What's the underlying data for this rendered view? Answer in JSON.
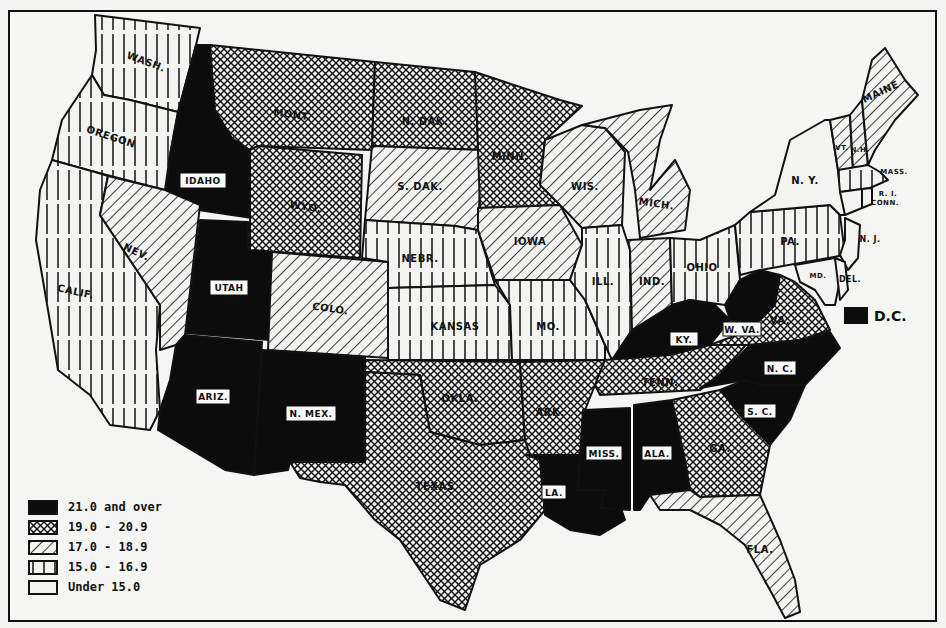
{
  "legend": {
    "items": [
      {
        "label": "21.0 and over",
        "pattern": "solid-black"
      },
      {
        "label": "19.0 - 20.9",
        "pattern": "crosshatch"
      },
      {
        "label": "17.0 - 18.9",
        "pattern": "diagonal-lines"
      },
      {
        "label": "15.0 - 16.9",
        "pattern": "vertical-lines"
      },
      {
        "label": "Under 15.0",
        "pattern": "blank"
      }
    ]
  },
  "dc": {
    "label": "D.C.",
    "category": "21.0 and over"
  },
  "states": {
    "wash": {
      "label": "WASH.",
      "category": "15.0 - 16.9"
    },
    "oregon": {
      "label": "OREGON",
      "category": "15.0 - 16.9"
    },
    "calif": {
      "label": "CALIF.",
      "category": "15.0 - 16.9"
    },
    "idaho": {
      "label": "IDAHO",
      "category": "21.0 and over"
    },
    "nev": {
      "label": "NEV.",
      "category": "17.0 - 18.9"
    },
    "utah": {
      "label": "UTAH",
      "category": "21.0 and over"
    },
    "ariz": {
      "label": "ARIZ.",
      "category": "21.0 and over"
    },
    "mont": {
      "label": "MONT.",
      "category": "19.0 - 20.9"
    },
    "wyo": {
      "label": "WYO.",
      "category": "19.0 - 20.9"
    },
    "colo": {
      "label": "COLO.",
      "category": "17.0 - 18.9"
    },
    "nmex": {
      "label": "N. MEX.",
      "category": "21.0 and over"
    },
    "ndak": {
      "label": "N. DAK.",
      "category": "19.0 - 20.9"
    },
    "sdak": {
      "label": "S. DAK.",
      "category": "17.0 - 18.9"
    },
    "nebr": {
      "label": "NEBR.",
      "category": "15.0 - 16.9"
    },
    "kansas": {
      "label": "KANSAS",
      "category": "15.0 - 16.9"
    },
    "okla": {
      "label": "OKLA.",
      "category": "19.0 - 20.9"
    },
    "texas": {
      "label": "TEXAS",
      "category": "19.0 - 20.9"
    },
    "minn": {
      "label": "MINN.",
      "category": "19.0 - 20.9"
    },
    "iowa": {
      "label": "IOWA",
      "category": "17.0 - 18.9"
    },
    "mo": {
      "label": "MO.",
      "category": "15.0 - 16.9"
    },
    "ark": {
      "label": "ARK.",
      "category": "19.0 - 20.9"
    },
    "la": {
      "label": "LA.",
      "category": "21.0 and over"
    },
    "wis": {
      "label": "WIS.",
      "category": "17.0 - 18.9"
    },
    "ill": {
      "label": "ILL.",
      "category": "15.0 - 16.9"
    },
    "mich": {
      "label": "MICH.",
      "category": "17.0 - 18.9"
    },
    "ind": {
      "label": "IND.",
      "category": "17.0 - 18.9"
    },
    "ohio": {
      "label": "OHIO",
      "category": "15.0 - 16.9"
    },
    "ky": {
      "label": "KY.",
      "category": "21.0 and over"
    },
    "tenn": {
      "label": "TENN.",
      "category": "19.0 - 20.9"
    },
    "miss": {
      "label": "MISS.",
      "category": "21.0 and over"
    },
    "ala": {
      "label": "ALA.",
      "category": "21.0 and over"
    },
    "ga": {
      "label": "GA.",
      "category": "19.0 - 20.9"
    },
    "fla": {
      "label": "FLA.",
      "category": "17.0 - 18.9"
    },
    "sc": {
      "label": "S. C.",
      "category": "21.0 and over"
    },
    "nc": {
      "label": "N. C.",
      "category": "21.0 and over"
    },
    "va": {
      "label": "VA.",
      "category": "19.0 - 20.9"
    },
    "wva": {
      "label": "W. VA.",
      "category": "21.0 and over"
    },
    "pa": {
      "label": "PA.",
      "category": "15.0 - 16.9"
    },
    "ny": {
      "label": "N. Y.",
      "category": "Under 15.0"
    },
    "nj": {
      "label": "N. J.",
      "category": "Under 15.0"
    },
    "del": {
      "label": "DEL.",
      "category": "Under 15.0"
    },
    "md": {
      "label": "MD.",
      "category": "Under 15.0"
    },
    "conn": {
      "label": "CONN.",
      "category": "Under 15.0"
    },
    "ri": {
      "label": "R. I.",
      "category": "Under 15.0"
    },
    "mass": {
      "label": "MASS.",
      "category": "15.0 - 16.9"
    },
    "vt": {
      "label": "VT.",
      "category": "17.0 - 18.9"
    },
    "nh": {
      "label": "N.H.",
      "category": "17.0 - 18.9"
    },
    "maine": {
      "label": "MAINE",
      "category": "17.0 - 18.9"
    }
  }
}
